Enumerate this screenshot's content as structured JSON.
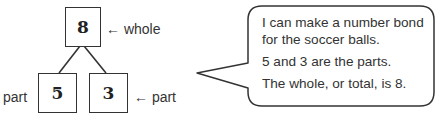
{
  "number_bond": {
    "whole": {
      "value": "8",
      "label": "← whole"
    },
    "parts": [
      {
        "value": "5",
        "label": "part"
      },
      {
        "value": "3",
        "label": "← part"
      }
    ]
  },
  "speech_bubble": {
    "lines": [
      "I can make a number bond",
      "for the soccer balls.",
      "5 and 3 are the parts.",
      "The whole, or total, is 8."
    ]
  },
  "colors": {
    "stroke": "#333333",
    "text": "#333333",
    "background": "#ffffff"
  }
}
